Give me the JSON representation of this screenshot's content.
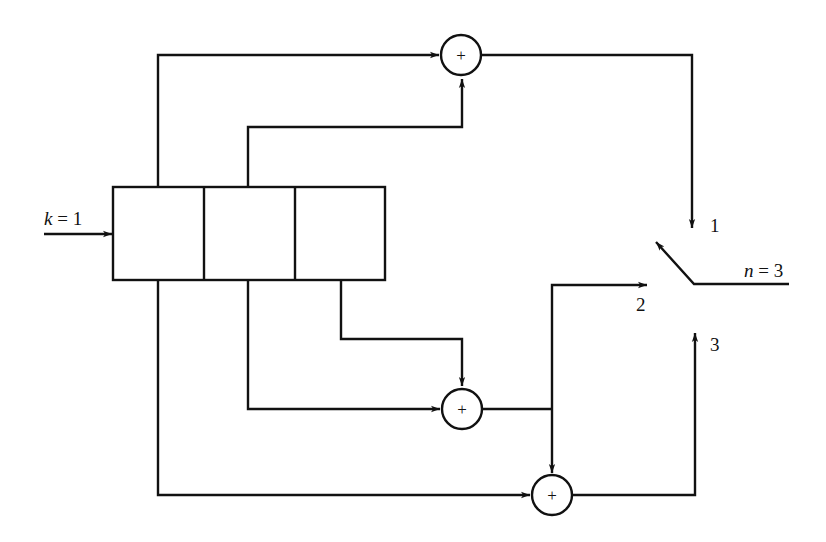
{
  "diagram": {
    "input_label": "k = 1",
    "input_var": "k",
    "input_val": "= 1",
    "output_label": "n = 3",
    "output_var": "n",
    "output_val": "= 3",
    "shift_register": {
      "stages": 3
    },
    "adders": [
      {
        "id": "adder-1",
        "symbol": "+",
        "inputs": [
          "stage-1",
          "stage-2"
        ],
        "output": "1"
      },
      {
        "id": "adder-2",
        "symbol": "+",
        "inputs": [
          "stage-2",
          "stage-3"
        ],
        "output": "2"
      },
      {
        "id": "adder-3",
        "symbol": "+",
        "inputs": [
          "stage-1",
          "adder-2"
        ],
        "output": "3"
      }
    ],
    "switch_positions": [
      "1",
      "2",
      "3"
    ],
    "colors": {
      "line": "#111111",
      "background": "#ffffff"
    }
  }
}
